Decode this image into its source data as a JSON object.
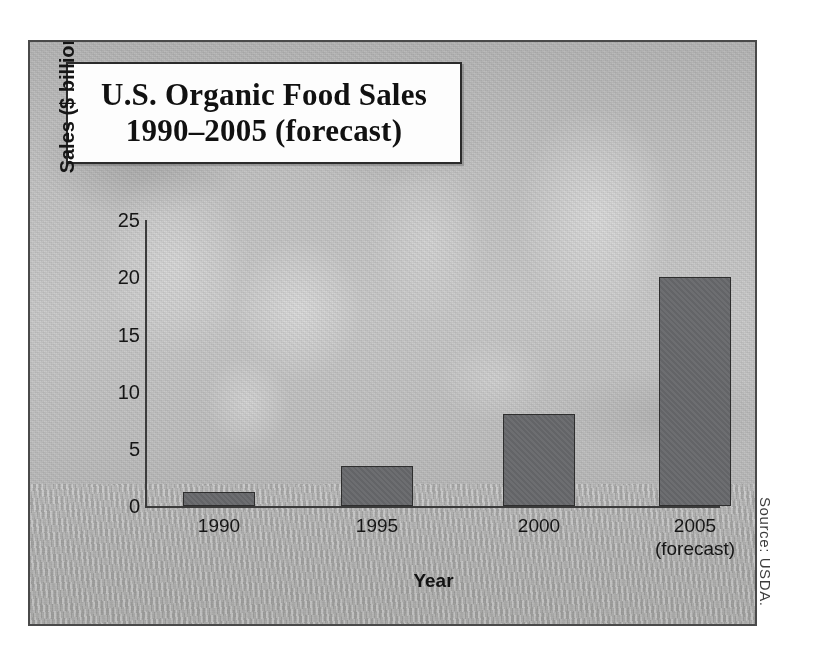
{
  "title": {
    "line1": "U.S. Organic Food Sales",
    "line2": "1990–2005 (forecast)"
  },
  "source_note": "Source: USDA.",
  "colors": {
    "bar_fill": "#67686b",
    "bar_outline": "#2e2e2e",
    "axis": "#3b3b3b",
    "frame": "#4a4a4a",
    "title_box_bg": "#fdfdfd",
    "text": "#161616"
  },
  "chart_data": {
    "type": "bar",
    "title": "U.S. Organic Food Sales 1990–2005 (forecast)",
    "xlabel": "Year",
    "ylabel": "Sales ($ billion)",
    "categories": [
      "1990",
      "1995",
      "2000",
      "2005"
    ],
    "category_sublabels": [
      "",
      "",
      "",
      "(forecast)"
    ],
    "values": [
      1.2,
      3.5,
      8,
      20
    ],
    "ylim": [
      0,
      25
    ],
    "yticks": [
      0,
      5,
      10,
      15,
      20,
      25
    ],
    "ytick_labels": [
      "0",
      "5",
      "10",
      "15",
      "20",
      "25"
    ],
    "grid": false,
    "legend": null,
    "annotations": [
      "Source: USDA."
    ]
  }
}
